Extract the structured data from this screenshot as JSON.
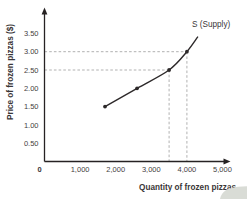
{
  "figure": {
    "corner_decoration_color": "#d9dcd6"
  },
  "chart_data": {
    "type": "line",
    "curve_label": "S (Supply)",
    "xlabel": "Quantity of frozen pizzas",
    "ylabel": "Price of frozen pizzas ($)",
    "xlim": [
      0,
      5200
    ],
    "ylim": [
      0,
      3.7
    ],
    "grid": false,
    "legend_position": "none",
    "x_ticks": [
      {
        "v": 0,
        "label": "0",
        "bold": true
      },
      {
        "v": 1000,
        "label": "1,000"
      },
      {
        "v": 2000,
        "label": "2,000"
      },
      {
        "v": 3000,
        "label": "3,000"
      },
      {
        "v": 4000,
        "label": "4,000"
      },
      {
        "v": 5000,
        "label": "5,000"
      }
    ],
    "y_ticks": [
      {
        "v": 0.5,
        "label": "0.50"
      },
      {
        "v": 1.0,
        "label": "1.00"
      },
      {
        "v": 1.5,
        "label": "1.50"
      },
      {
        "v": 2.0,
        "label": "2.00"
      },
      {
        "v": 2.5,
        "label": "2.50"
      },
      {
        "v": 3.0,
        "label": "3.00"
      },
      {
        "v": 3.5,
        "label": "3.50"
      }
    ],
    "series": [
      {
        "name": "S (Supply)",
        "points": [
          {
            "q": 1700,
            "p": 1.5,
            "dot": true
          },
          {
            "q": 2600,
            "p": 2.0,
            "dot": true
          },
          {
            "q": 3500,
            "p": 2.5,
            "dot": true
          },
          {
            "q": 4000,
            "p": 3.0,
            "dot": true
          },
          {
            "q": 4300,
            "p": 3.4,
            "dot": false
          }
        ]
      }
    ],
    "guides": [
      {
        "q": 3500,
        "p": 2.5
      },
      {
        "q": 4000,
        "p": 3.0
      }
    ],
    "colors": {
      "curve": "#2d292a",
      "axis": "#262223",
      "dot": "#2d292a",
      "guide": "#a8a8a8",
      "tick_text": "#454142",
      "title_text": "#3a3637"
    }
  }
}
